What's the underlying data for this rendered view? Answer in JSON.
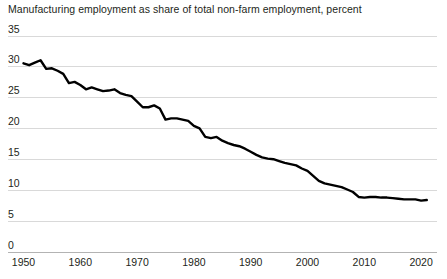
{
  "chart_data": {
    "type": "line",
    "title": "Manufacturing employment as share of total non-farm employment, percent",
    "subtitle": "",
    "xlabel": "",
    "ylabel": "",
    "xlim": [
      1950,
      2021
    ],
    "ylim": [
      0,
      35
    ],
    "grid": true,
    "legend": null,
    "legend_position": "none",
    "line_color": "#000000",
    "grid_color": "#d9d9d9",
    "background_color": "#ffffff",
    "text_color": "#231f20",
    "y_ticks": [
      0,
      5,
      10,
      15,
      20,
      25,
      30,
      35
    ],
    "y_tick_labels": [
      "0",
      "5",
      "10",
      "15",
      "20",
      "25",
      "30",
      "35"
    ],
    "x_ticks": [
      1950,
      1960,
      1970,
      1980,
      1990,
      2000,
      2010,
      2020
    ],
    "x_tick_labels": [
      "1950",
      "1960",
      "1970",
      "1980",
      "1990",
      "2000",
      "2010",
      "2020"
    ],
    "series": [
      {
        "name": "Manufacturing share of non-farm employment",
        "x": [
          1950,
          1951,
          1952,
          1953,
          1954,
          1955,
          1956,
          1957,
          1958,
          1959,
          1960,
          1961,
          1962,
          1963,
          1964,
          1965,
          1966,
          1967,
          1968,
          1969,
          1970,
          1971,
          1972,
          1973,
          1974,
          1975,
          1976,
          1977,
          1978,
          1979,
          1980,
          1981,
          1982,
          1983,
          1984,
          1985,
          1986,
          1987,
          1988,
          1989,
          1990,
          1991,
          1992,
          1993,
          1994,
          1995,
          1996,
          1997,
          1998,
          1999,
          2000,
          2001,
          2002,
          2003,
          2004,
          2005,
          2006,
          2007,
          2008,
          2009,
          2010,
          2011,
          2012,
          2013,
          2014,
          2015,
          2016,
          2017,
          2018,
          2019,
          2020,
          2021
        ],
        "y": [
          30.5,
          30.2,
          30.6,
          31.0,
          29.6,
          29.7,
          29.3,
          28.8,
          27.3,
          27.5,
          27.0,
          26.3,
          26.6,
          26.3,
          26.0,
          26.1,
          26.3,
          25.7,
          25.4,
          25.2,
          24.3,
          23.4,
          23.4,
          23.7,
          23.2,
          21.4,
          21.6,
          21.6,
          21.4,
          21.2,
          20.4,
          20.0,
          18.6,
          18.4,
          18.6,
          18.0,
          17.6,
          17.3,
          17.1,
          16.7,
          16.2,
          15.7,
          15.3,
          15.1,
          15.0,
          14.7,
          14.4,
          14.2,
          14.0,
          13.5,
          13.1,
          12.3,
          11.5,
          11.1,
          10.9,
          10.7,
          10.5,
          10.1,
          9.7,
          8.9,
          8.8,
          8.9,
          8.9,
          8.8,
          8.8,
          8.7,
          8.6,
          8.5,
          8.5,
          8.5,
          8.3,
          8.4
        ]
      }
    ]
  }
}
